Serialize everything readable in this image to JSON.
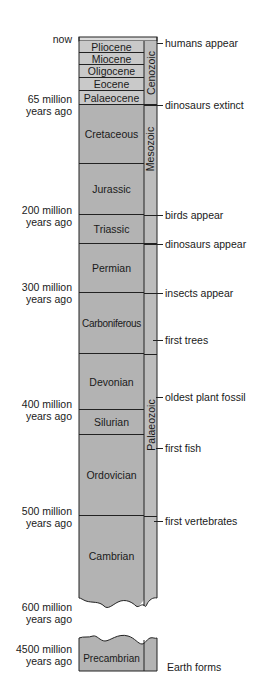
{
  "diagram": {
    "type": "geologic-timescale",
    "colors": {
      "cenozoic_epoch_fill": "#c9c9c9",
      "period_fill": "#b3b3b3",
      "era_fill": "#bdbdbd",
      "top_strip_fill": "#dcdcdc",
      "line": "#222222",
      "text": "#1a1a1a"
    },
    "time_labels": [
      {
        "text": "now",
        "y": 39
      },
      {
        "line1": "65 million",
        "line2": "years ago",
        "y": 98
      },
      {
        "line1": "200 million",
        "line2": "years ago",
        "y": 209
      },
      {
        "line1": "300 million",
        "line2": "years ago",
        "y": 286
      },
      {
        "line1": "400 million",
        "line2": "years ago",
        "y": 403
      },
      {
        "line1": "500 million",
        "line2": "years ago",
        "y": 510
      },
      {
        "line1": "600 million",
        "line2": "years ago",
        "y": 602
      },
      {
        "line1": "4500 million",
        "line2": "years ago",
        "y": 645
      }
    ],
    "periods": [
      {
        "name": "Pliocene",
        "top": 41,
        "bottom": 53
      },
      {
        "name": "Miocene",
        "top": 53,
        "bottom": 65
      },
      {
        "name": "Oligocene",
        "top": 65,
        "bottom": 78
      },
      {
        "name": "Eocene",
        "top": 78,
        "bottom": 91
      },
      {
        "name": "Palaeocene",
        "top": 91,
        "bottom": 105
      },
      {
        "name": "Cretaceous",
        "top": 105,
        "bottom": 164
      },
      {
        "name": "Jurassic",
        "top": 164,
        "bottom": 215
      },
      {
        "name": "Triassic",
        "top": 215,
        "bottom": 244
      },
      {
        "name": "Permian",
        "top": 244,
        "bottom": 293
      },
      {
        "name": "Carboniferous",
        "top": 293,
        "bottom": 354
      },
      {
        "name": "Devonian",
        "top": 354,
        "bottom": 410
      },
      {
        "name": "Silurian",
        "top": 410,
        "bottom": 435
      },
      {
        "name": "Ordovician",
        "top": 435,
        "bottom": 516
      },
      {
        "name": "Cambrian",
        "top": 516,
        "bottom": 600
      },
      {
        "name": "Precambrian",
        "top": 637,
        "bottom": 671
      }
    ],
    "eras": [
      {
        "name": "Cenozoic",
        "top": 38,
        "bottom": 105
      },
      {
        "name": "Mesozoic",
        "top": 105,
        "bottom": 244
      },
      {
        "name": "Palaeozoic",
        "top": 244,
        "bottom": 600
      }
    ],
    "events": [
      {
        "text": "humans appear",
        "y": 43
      },
      {
        "text": "dinosaurs extinct",
        "y": 105
      },
      {
        "text": "birds appear",
        "y": 215
      },
      {
        "text": "dinosaurs appear",
        "y": 244
      },
      {
        "text": "insects appear",
        "y": 293
      },
      {
        "text": "first trees",
        "y": 340
      },
      {
        "text": "oldest plant fossil",
        "y": 397
      },
      {
        "text": "first fish",
        "y": 448
      },
      {
        "text": "first vertebrates",
        "y": 521
      },
      {
        "text": "Earth forms",
        "y": 667
      }
    ]
  }
}
